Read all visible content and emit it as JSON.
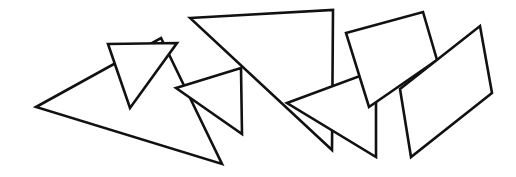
{
  "canvas": {
    "width": 516,
    "height": 177,
    "background": "#ffffff",
    "stroke": "#111111"
  },
  "shapes": [
    {
      "id": "large-left-triangle",
      "type": "triangle",
      "points": "36,107 161,38 222,164"
    },
    {
      "id": "small-inverted-triangle",
      "type": "triangle",
      "points": "108,44 177,43 130,108"
    },
    {
      "id": "large-top-triangle",
      "type": "triangle",
      "points": "190,18 333,10 332,150"
    },
    {
      "id": "middle-small-triangle",
      "type": "triangle",
      "points": "176,88 241,68 242,134"
    },
    {
      "id": "lower-right-triangle",
      "type": "triangle",
      "points": "287,103 376,70 376,157"
    },
    {
      "id": "upper-right-quadrilateral",
      "type": "quadrilateral",
      "points": "346,33 423,12 437,60 369,107"
    },
    {
      "id": "right-parallelogram",
      "type": "quadrilateral",
      "points": "400,89 480,26 492,93 411,157"
    }
  ]
}
